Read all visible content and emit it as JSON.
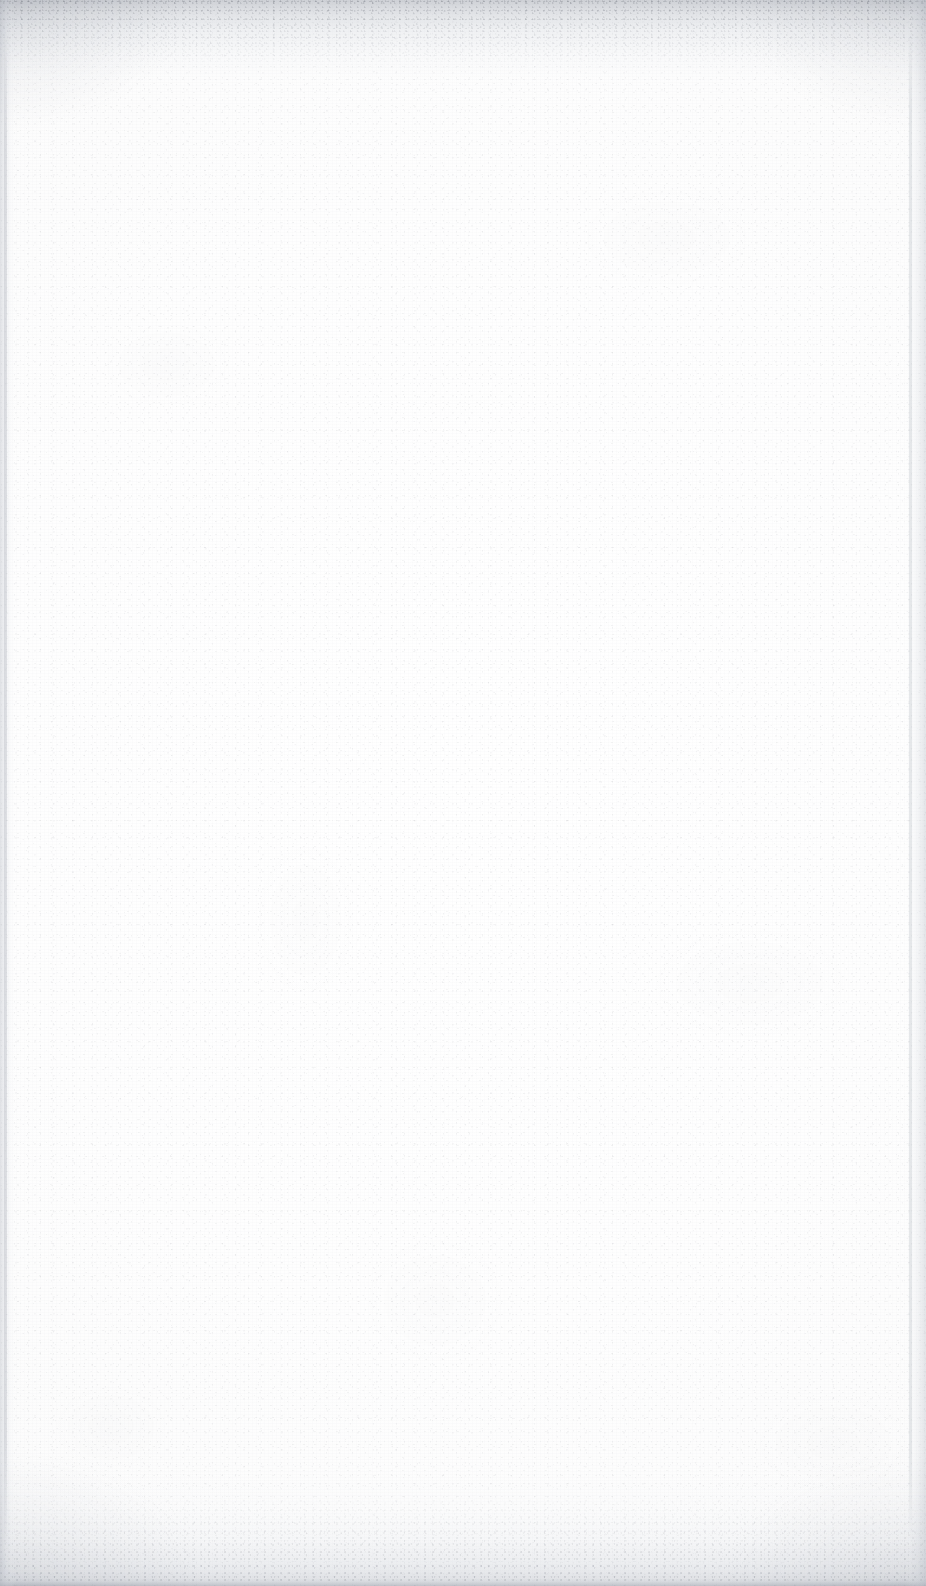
{
  "page": {
    "kind": "scanned-document-page",
    "state": "blank",
    "visible_text": [],
    "width_px": 926,
    "height_px": 1586,
    "background_color": "#fdfdfd",
    "paper_tone": "#ffffff",
    "grain_color": "#7c8089"
  },
  "artifacts": {
    "top_edge": {
      "name": "top-scan-shadow",
      "color": "#b2b6be",
      "height_px": 95
    },
    "bottom_edge": {
      "name": "bottom-scan-shadow",
      "color": "#babec6",
      "height_px": 120,
      "terminator_line_color": "#a8acb5"
    },
    "left_edge": {
      "name": "left-scan-edge",
      "color": "#bec2ca",
      "width_px": 16,
      "line_color": "#b0b4bd"
    },
    "right_edge": {
      "name": "right-scan-edge",
      "color": "#c0c4cc",
      "width_px": 22,
      "line_color": "#b4b8c1"
    },
    "vignette": {
      "name": "corner-vignette",
      "color": "#aaaeb7"
    }
  }
}
